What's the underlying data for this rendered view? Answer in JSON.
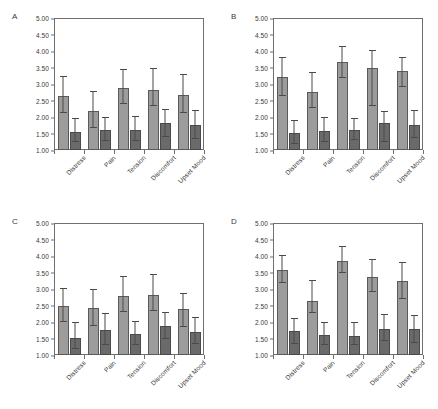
{
  "figure": {
    "background_color": "#ffffff",
    "light_bar_color": "#9c9c9c",
    "dark_bar_color": "#6a6a6a",
    "axis_color": "#6f6f6f"
  },
  "chart_data": [
    {
      "type": "bar",
      "panel": "A",
      "title": "",
      "xlabel": "",
      "ylabel": "",
      "ylim": [
        1.0,
        5.0
      ],
      "ytick_labels": [
        "5.00",
        "4.50",
        "4.00",
        "3.50",
        "3.00",
        "2.50",
        "2.00",
        "1.50",
        "1.00"
      ],
      "ytick_values": [
        5.0,
        4.5,
        4.0,
        3.5,
        3.0,
        2.5,
        2.0,
        1.5,
        1.0
      ],
      "grid": false,
      "legend": "none",
      "categories": [
        "Distress",
        "Pain",
        "Tension",
        "Discomfort",
        "Upset Mood"
      ],
      "series": [
        {
          "name": "light",
          "values": [
            2.65,
            2.17,
            2.87,
            2.82,
            2.66
          ],
          "errors_low": [
            0.57,
            0.52,
            0.52,
            0.53,
            0.57
          ],
          "errors_high": [
            0.57,
            0.6,
            0.55,
            0.65,
            0.6
          ]
        },
        {
          "name": "dark",
          "values": [
            1.56,
            1.6,
            1.61,
            1.83,
            1.77
          ],
          "errors_low": [
            0.36,
            0.37,
            0.36,
            0.46,
            0.46
          ],
          "errors_high": [
            0.38,
            0.37,
            0.39,
            0.39,
            0.4
          ]
        }
      ]
    },
    {
      "type": "bar",
      "panel": "B",
      "title": "",
      "xlabel": "",
      "ylabel": "",
      "ylim": [
        1.0,
        5.0
      ],
      "ytick_labels": [
        "5.00",
        "4.50",
        "4.00",
        "3.50",
        "3.00",
        "2.50",
        "2.00",
        "1.50",
        "1.00"
      ],
      "ytick_values": [
        5.0,
        4.5,
        4.0,
        3.5,
        3.0,
        2.5,
        2.0,
        1.5,
        1.0
      ],
      "grid": false,
      "legend": "none",
      "categories": [
        "Distress",
        "Pain",
        "Tension",
        "Discomfort",
        "Upset Mood"
      ],
      "series": [
        {
          "name": "light",
          "values": [
            3.22,
            2.77,
            3.68,
            3.5,
            3.38
          ],
          "errors_low": [
            0.6,
            0.53,
            0.52,
            1.21,
            0.49
          ],
          "errors_high": [
            0.58,
            0.55,
            0.44,
            0.5,
            0.42
          ]
        },
        {
          "name": "dark",
          "values": [
            1.53,
            1.57,
            1.61,
            1.82,
            1.77
          ],
          "errors_low": [
            0.37,
            0.35,
            0.33,
            0.62,
            0.43
          ],
          "errors_high": [
            0.35,
            0.41,
            0.34,
            0.34,
            0.4
          ]
        }
      ]
    },
    {
      "type": "bar",
      "panel": "C",
      "title": "",
      "xlabel": "",
      "ylabel": "",
      "ylim": [
        1.0,
        5.0
      ],
      "ytick_labels": [
        "5.00",
        "4.50",
        "4.00",
        "3.50",
        "3.00",
        "2.50",
        "2.00",
        "1.50",
        "1.00"
      ],
      "ytick_values": [
        5.0,
        4.5,
        4.0,
        3.5,
        3.0,
        2.5,
        2.0,
        1.5,
        1.0
      ],
      "grid": false,
      "legend": "none",
      "categories": [
        "Distress",
        "Pain",
        "Tension",
        "Discomfort",
        "Upset Mood"
      ],
      "series": [
        {
          "name": "light",
          "values": [
            2.49,
            2.41,
            2.8,
            2.83,
            2.38
          ],
          "errors_low": [
            0.53,
            0.56,
            0.52,
            0.53,
            0.55
          ],
          "errors_high": [
            0.51,
            0.56,
            0.55,
            0.6,
            0.47
          ]
        },
        {
          "name": "dark",
          "values": [
            1.52,
            1.76,
            1.63,
            1.88,
            1.71
          ],
          "errors_low": [
            0.37,
            0.48,
            0.36,
            0.44,
            0.41
          ],
          "errors_high": [
            0.44,
            0.48,
            0.38,
            0.4,
            0.4
          ]
        }
      ]
    },
    {
      "type": "bar",
      "panel": "D",
      "title": "",
      "xlabel": "",
      "ylabel": "",
      "ylim": [
        1.0,
        5.0
      ],
      "ytick_labels": [
        "5.00",
        "4.50",
        "4.00",
        "3.50",
        "3.00",
        "2.50",
        "2.00",
        "1.50",
        "1.00"
      ],
      "ytick_values": [
        5.0,
        4.5,
        4.0,
        3.5,
        3.0,
        2.5,
        2.0,
        1.5,
        1.0
      ],
      "grid": false,
      "legend": "none",
      "categories": [
        "Distress",
        "Pain",
        "Tension",
        "Discomfort",
        "Upset Mood"
      ],
      "series": [
        {
          "name": "light",
          "values": [
            3.59,
            2.65,
            3.84,
            3.36,
            3.23
          ],
          "errors_low": [
            0.45,
            0.42,
            0.38,
            0.47,
            0.56
          ],
          "errors_high": [
            0.41,
            0.6,
            0.42,
            0.52,
            0.55
          ]
        },
        {
          "name": "dark",
          "values": [
            1.72,
            1.6,
            1.58,
            1.79,
            1.79
          ],
          "errors_low": [
            0.43,
            0.32,
            0.31,
            0.4,
            0.45
          ],
          "errors_high": [
            0.37,
            0.37,
            0.4,
            0.42,
            0.38
          ]
        }
      ]
    }
  ]
}
